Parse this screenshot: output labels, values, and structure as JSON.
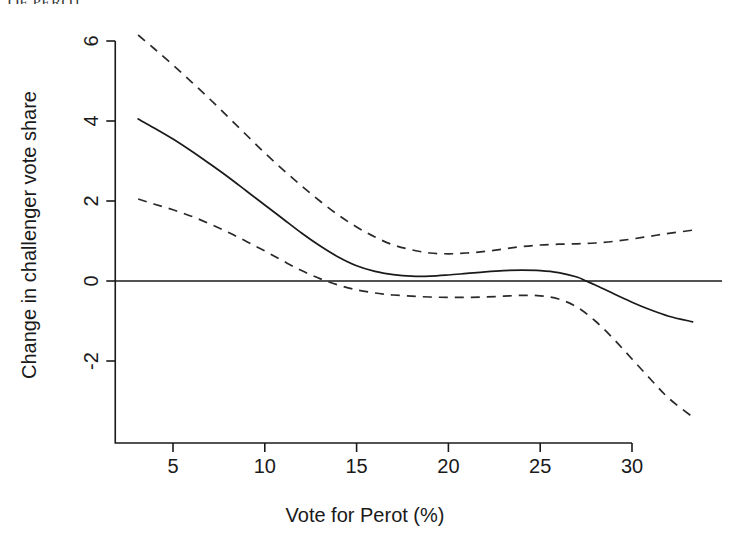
{
  "page": {
    "cropped_header_text": "OF PEROT"
  },
  "chart_data": {
    "type": "line",
    "title": "",
    "xlabel": "Vote for Perot (%)",
    "ylabel": "Change in challenger vote share",
    "xlim": [
      2.4,
      34.2
    ],
    "ylim": [
      -3.9,
      6.6
    ],
    "xticks": [
      5,
      10,
      15,
      20,
      25,
      30
    ],
    "xtick_labels": [
      "5",
      "10",
      "15",
      "20",
      "25",
      "30"
    ],
    "yticks": [
      -2,
      0,
      2,
      4,
      6
    ],
    "ytick_labels": [
      "-2",
      "0",
      "2",
      "4",
      "6"
    ],
    "grid": false,
    "legend": null,
    "reference_lines": [
      {
        "name": "zero-line",
        "orientation": "horizontal",
        "y": 0,
        "style": "solid"
      }
    ],
    "series": [
      {
        "name": "fitted-effect",
        "style": "solid",
        "color": "#1a1a1a",
        "x": [
          3.1,
          4.0,
          5.0,
          6.0,
          7.0,
          8.0,
          9.0,
          10.0,
          11.0,
          12.0,
          13.0,
          14.0,
          15.0,
          16.0,
          17.0,
          18.0,
          19.0,
          20.0,
          21.0,
          22.0,
          23.0,
          24.0,
          25.0,
          26.0,
          27.0,
          27.5,
          28.0,
          29.0,
          30.0,
          31.0,
          32.0,
          33.3
        ],
        "y": [
          4.05,
          3.82,
          3.55,
          3.25,
          2.93,
          2.6,
          2.25,
          1.9,
          1.55,
          1.2,
          0.88,
          0.6,
          0.38,
          0.24,
          0.16,
          0.12,
          0.12,
          0.15,
          0.19,
          0.23,
          0.26,
          0.27,
          0.26,
          0.21,
          0.1,
          0.0,
          -0.1,
          -0.32,
          -0.53,
          -0.72,
          -0.88,
          -1.02
        ]
      },
      {
        "name": "upper-confidence-band",
        "style": "dashed",
        "color": "#2a2a2a",
        "x": [
          3.1,
          4.0,
          5.0,
          6.0,
          7.0,
          8.0,
          9.0,
          10.0,
          11.0,
          12.0,
          13.0,
          14.0,
          15.0,
          16.0,
          17.0,
          18.0,
          19.0,
          20.0,
          21.0,
          22.0,
          23.0,
          24.0,
          25.0,
          26.0,
          27.0,
          28.0,
          29.0,
          30.0,
          31.0,
          32.0,
          33.3
        ],
        "y": [
          6.15,
          5.8,
          5.4,
          4.98,
          4.55,
          4.1,
          3.65,
          3.2,
          2.78,
          2.38,
          2.0,
          1.65,
          1.35,
          1.1,
          0.9,
          0.78,
          0.7,
          0.68,
          0.7,
          0.74,
          0.8,
          0.86,
          0.9,
          0.92,
          0.93,
          0.95,
          0.99,
          1.05,
          1.12,
          1.19,
          1.27
        ]
      },
      {
        "name": "lower-confidence-band",
        "style": "dashed",
        "color": "#2a2a2a",
        "x": [
          3.1,
          4.0,
          5.0,
          6.0,
          7.0,
          8.0,
          9.0,
          10.0,
          11.0,
          12.0,
          13.0,
          14.0,
          15.0,
          16.0,
          16.5,
          17.0,
          18.0,
          19.0,
          20.0,
          21.0,
          22.0,
          23.0,
          24.0,
          25.0,
          26.0,
          27.0,
          28.0,
          29.0,
          30.0,
          31.0,
          32.0,
          33.3
        ],
        "y": [
          2.05,
          1.92,
          1.78,
          1.62,
          1.43,
          1.22,
          0.99,
          0.75,
          0.5,
          0.26,
          0.06,
          -0.1,
          -0.22,
          -0.3,
          -0.33,
          -0.35,
          -0.38,
          -0.4,
          -0.41,
          -0.41,
          -0.4,
          -0.38,
          -0.36,
          -0.37,
          -0.45,
          -0.65,
          -1.0,
          -1.45,
          -1.95,
          -2.45,
          -2.93,
          -3.4
        ]
      }
    ]
  }
}
